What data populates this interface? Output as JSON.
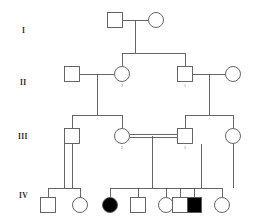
{
  "figure": {
    "type": "pedigree-chart",
    "width": 272,
    "height": 223,
    "background_color": "#ffffff",
    "line_color": "#555555",
    "symbol_stroke_color": "#555555",
    "affected_fill_color": "#000000",
    "unaffected_fill_color": "#ffffff",
    "stroke_width": 0.9,
    "square_size": 15,
    "circle_radius": 7.5,
    "legend": {
      "square_meaning": "male",
      "circle_meaning": "female",
      "filled_meaning": "affected",
      "open_meaning": "unaffected",
      "double_line_meaning": "consanguineous mating"
    }
  },
  "generation_labels": [
    {
      "text": "I",
      "x": 22,
      "y": 27
    },
    {
      "text": "II",
      "x": 20,
      "y": 79
    },
    {
      "text": "III",
      "x": 18,
      "y": 133
    },
    {
      "text": "IV",
      "x": 19,
      "y": 192
    }
  ],
  "individuals": [
    {
      "id": "I-1",
      "generation": "I",
      "sex": "male",
      "shape": "square",
      "affected": false,
      "cx": 115,
      "cy": 20,
      "number": ""
    },
    {
      "id": "I-2",
      "generation": "I",
      "sex": "female",
      "shape": "circle",
      "affected": false,
      "cx": 156,
      "cy": 20,
      "number": ""
    },
    {
      "id": "II-1",
      "generation": "II",
      "sex": "male",
      "shape": "square",
      "affected": false,
      "cx": 72,
      "cy": 74,
      "number": ""
    },
    {
      "id": "II-2",
      "generation": "II",
      "sex": "female",
      "shape": "circle",
      "affected": false,
      "cx": 122,
      "cy": 74,
      "number": "2"
    },
    {
      "id": "II-3",
      "generation": "II",
      "sex": "male",
      "shape": "square",
      "affected": false,
      "cx": 185,
      "cy": 74,
      "number": "1"
    },
    {
      "id": "II-4",
      "generation": "II",
      "sex": "female",
      "shape": "circle",
      "affected": false,
      "cx": 233,
      "cy": 74,
      "number": ""
    },
    {
      "id": "III-1",
      "generation": "III",
      "sex": "male",
      "shape": "square",
      "affected": false,
      "cx": 72,
      "cy": 136,
      "number": ""
    },
    {
      "id": "III-2",
      "generation": "III",
      "sex": "female",
      "shape": "circle",
      "affected": false,
      "cx": 122,
      "cy": 136,
      "number": "2"
    },
    {
      "id": "III-3",
      "generation": "III",
      "sex": "male",
      "shape": "square",
      "affected": false,
      "cx": 185,
      "cy": 136,
      "number": "1"
    },
    {
      "id": "III-4",
      "generation": "III",
      "sex": "female",
      "shape": "circle",
      "affected": false,
      "cx": 233,
      "cy": 136,
      "number": ""
    },
    {
      "id": "IV-1",
      "generation": "IV",
      "sex": "male",
      "shape": "square",
      "affected": false,
      "cx": 48,
      "cy": 205,
      "number": ""
    },
    {
      "id": "IV-2",
      "generation": "IV",
      "sex": "female",
      "shape": "circle",
      "affected": false,
      "cx": 80,
      "cy": 205,
      "number": ""
    },
    {
      "id": "IV-3",
      "generation": "IV",
      "sex": "female",
      "shape": "circle",
      "affected": true,
      "cx": 110,
      "cy": 205,
      "number": ""
    },
    {
      "id": "IV-4",
      "generation": "IV",
      "sex": "male",
      "shape": "square",
      "affected": false,
      "cx": 138,
      "cy": 205,
      "number": ""
    },
    {
      "id": "IV-5",
      "generation": "IV",
      "sex": "female",
      "shape": "circle",
      "affected": false,
      "cx": 166,
      "cy": 205,
      "number": ""
    },
    {
      "id": "IV-6",
      "generation": "IV",
      "sex": "male",
      "shape": "square",
      "affected": true,
      "cx": 194,
      "cy": 205,
      "number": ""
    },
    {
      "id": "IV-7",
      "generation": "IV",
      "sex": "female",
      "shape": "circle",
      "affected": false,
      "cx": 222,
      "cy": 205,
      "number": ""
    },
    {
      "id": "IV-8",
      "generation": "IV",
      "sex": "male",
      "shape": "square",
      "affected": false,
      "cx": 180,
      "cy": 205,
      "number": ""
    }
  ],
  "matings": [
    {
      "id": "mating-I",
      "partner_a": "I-1",
      "partner_b": "I-2",
      "y": 20,
      "x1": 123,
      "x2": 148,
      "consanguineous": false
    },
    {
      "id": "mating-II-left",
      "partner_a": "II-1",
      "partner_b": "II-2",
      "y": 74,
      "x1": 80,
      "x2": 114,
      "consanguineous": false
    },
    {
      "id": "mating-II-right",
      "partner_a": "II-3",
      "partner_b": "II-4",
      "y": 74,
      "x1": 193,
      "x2": 225,
      "consanguineous": false
    },
    {
      "id": "mating-III-mid",
      "partner_a": "III-2",
      "partner_b": "III-3",
      "y": 136,
      "x1": 130,
      "x2": 177,
      "consanguineous": true
    }
  ],
  "sibships": [
    {
      "id": "sibship-I",
      "parents_mating": "mating-I",
      "drop_x": 135,
      "drop_from_y": 20,
      "drop_to_y": 53,
      "sib_bar_y": 53,
      "sib_bar_x1": 122,
      "sib_bar_x2": 185,
      "children_x": [
        122,
        185
      ],
      "children_top_y": 66
    },
    {
      "id": "sibship-II-left",
      "parents_mating": "mating-II-left",
      "drop_x": 97,
      "drop_from_y": 74,
      "drop_to_y": 115,
      "sib_bar_y": 115,
      "sib_bar_x1": 72,
      "sib_bar_x2": 122,
      "children_x": [
        72,
        122
      ],
      "children_top_y": 128
    },
    {
      "id": "sibship-II-right",
      "parents_mating": "mating-II-right",
      "drop_x": 209,
      "drop_from_y": 74,
      "drop_to_y": 115,
      "sib_bar_y": 115,
      "sib_bar_x1": 185,
      "sib_bar_x2": 233,
      "children_x": [
        185,
        233
      ],
      "children_top_y": 128
    },
    {
      "id": "sibship-IV-left",
      "parents_mating": "parent-III-1",
      "drop_x": 64,
      "drop_from_y": 144,
      "drop_to_y": 188,
      "sib_bar_y": 188,
      "sib_bar_x1": 48,
      "sib_bar_x2": 80,
      "children_x": [
        48,
        80
      ],
      "children_top_y": 197
    },
    {
      "id": "sibship-IV-center",
      "parents_mating": "mating-III-mid",
      "drop_x": 152,
      "drop_from_y": 136,
      "drop_to_y": 188,
      "sib_bar_y": 188,
      "sib_bar_x1": 110,
      "sib_bar_x2": 194,
      "children_x": [
        110,
        138,
        166,
        194
      ],
      "children_top_y": 197
    },
    {
      "id": "sibship-IV-right",
      "parents_mating": "parent-III-4",
      "drop_x": 201,
      "drop_from_y": 144,
      "drop_to_y": 188,
      "sib_bar_y": 188,
      "sib_bar_x1": 180,
      "sib_bar_x2": 222,
      "children_x": [
        180,
        222
      ],
      "children_top_y": 197
    }
  ],
  "parent_drops": [
    {
      "id": "drop-III-1-to-IV",
      "x": 72,
      "from_y": 144,
      "to_y": 188
    },
    {
      "id": "drop-III-4-to-IV",
      "x": 233,
      "from_y": 144,
      "to_y": 188
    }
  ],
  "affected_summary": {
    "total_individuals": 18,
    "affected_individuals": [
      "IV-3",
      "IV-6"
    ],
    "affected_count": 2
  }
}
